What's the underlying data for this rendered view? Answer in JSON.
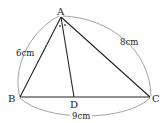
{
  "diagram": {
    "type": "geometry-triangle",
    "points": {
      "A": {
        "label": "A",
        "x": 61,
        "y": 17
      },
      "B": {
        "label": "B",
        "x": 20,
        "y": 97
      },
      "C": {
        "label": "C",
        "x": 150,
        "y": 97
      },
      "D": {
        "label": "D",
        "x": 74,
        "y": 97
      }
    },
    "measurements": {
      "AB": "6cm",
      "AC": "8cm",
      "BC": "9cm"
    },
    "angle_marks": [
      "•",
      "•"
    ],
    "colors": {
      "stroke": "#222222",
      "arc": "#888888"
    }
  }
}
